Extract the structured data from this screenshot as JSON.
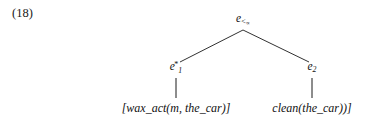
{
  "example": {
    "number_label": "(18)"
  },
  "tree": {
    "root": {
      "base": "e",
      "subscript_relation": "<",
      "subscript_relation_inner": "∝"
    },
    "children": [
      {
        "id": "e1",
        "base": "e",
        "subscript": "1",
        "superscript": "*",
        "leaf_text": "[wax_act(m, the_car)]"
      },
      {
        "id": "e2",
        "base": "e",
        "subscript": "2",
        "superscript": "",
        "leaf_text": "clean(the_car))]"
      }
    ]
  },
  "style": {
    "line_color": "#1a1a1a",
    "text_color": "#111111",
    "background": "#ffffff"
  }
}
